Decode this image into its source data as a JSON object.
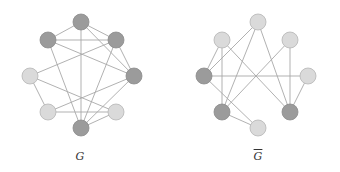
{
  "colors": {
    "dark_node": "#9b9b9b",
    "light_node": "#dadada",
    "node_stroke": "#8a8a8a",
    "light_stroke": "#b5b5b5",
    "edge": "#a8a8a8",
    "background": "#ffffff"
  },
  "graphs": [
    {
      "id": "G",
      "label": "G",
      "overline": false,
      "label_pos": [
        80,
        150
      ],
      "nodes": [
        {
          "id": "top",
          "x": 81,
          "y": 22,
          "shade": "dark"
        },
        {
          "id": "ul",
          "x": 48,
          "y": 40,
          "shade": "dark"
        },
        {
          "id": "ur",
          "x": 116,
          "y": 40,
          "shade": "dark"
        },
        {
          "id": "l",
          "x": 30,
          "y": 76,
          "shade": "light"
        },
        {
          "id": "r",
          "x": 134,
          "y": 76,
          "shade": "dark"
        },
        {
          "id": "ll",
          "x": 48,
          "y": 112,
          "shade": "light"
        },
        {
          "id": "lr",
          "x": 116,
          "y": 112,
          "shade": "light"
        },
        {
          "id": "bot",
          "x": 81,
          "y": 128,
          "shade": "dark"
        }
      ],
      "edges": [
        [
          "top",
          "ul"
        ],
        [
          "top",
          "ur"
        ],
        [
          "top",
          "r"
        ],
        [
          "top",
          "bot"
        ],
        [
          "ul",
          "ur"
        ],
        [
          "ul",
          "r"
        ],
        [
          "ul",
          "bot"
        ],
        [
          "ur",
          "l"
        ],
        [
          "ur",
          "r"
        ],
        [
          "ur",
          "bot"
        ],
        [
          "l",
          "lr"
        ],
        [
          "l",
          "ll"
        ],
        [
          "ll",
          "lr"
        ],
        [
          "ll",
          "r"
        ],
        [
          "r",
          "bot"
        ],
        [
          "lr",
          "bot"
        ]
      ]
    },
    {
      "id": "Gbar",
      "label": "G",
      "overline": true,
      "label_pos": [
        258,
        150
      ],
      "nodes": [
        {
          "id": "top",
          "x": 258,
          "y": 22,
          "shade": "light"
        },
        {
          "id": "ul",
          "x": 222,
          "y": 40,
          "shade": "light"
        },
        {
          "id": "ur",
          "x": 290,
          "y": 40,
          "shade": "light"
        },
        {
          "id": "l",
          "x": 204,
          "y": 76,
          "shade": "dark"
        },
        {
          "id": "r",
          "x": 308,
          "y": 76,
          "shade": "light"
        },
        {
          "id": "ll",
          "x": 222,
          "y": 112,
          "shade": "dark"
        },
        {
          "id": "lr",
          "x": 290,
          "y": 112,
          "shade": "dark"
        },
        {
          "id": "bot",
          "x": 258,
          "y": 128,
          "shade": "light"
        }
      ],
      "edges": [
        [
          "top",
          "l"
        ],
        [
          "top",
          "ll"
        ],
        [
          "top",
          "lr"
        ],
        [
          "ul",
          "l"
        ],
        [
          "ul",
          "ll"
        ],
        [
          "ul",
          "lr"
        ],
        [
          "ur",
          "ll"
        ],
        [
          "ur",
          "lr"
        ],
        [
          "l",
          "r"
        ],
        [
          "l",
          "bot"
        ],
        [
          "ll",
          "bot"
        ],
        [
          "r",
          "lr"
        ]
      ]
    }
  ],
  "node_radius": 8
}
